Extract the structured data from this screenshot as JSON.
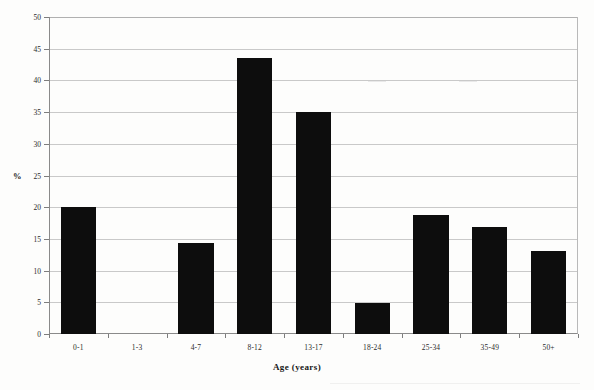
{
  "chart_data": {
    "type": "bar",
    "title": "",
    "xlabel": "Age (years)",
    "ylabel": "%",
    "categories": [
      "0-1",
      "1-3",
      "4-7",
      "8-12",
      "13-17",
      "18-24",
      "25-34",
      "35-49",
      "50+"
    ],
    "values": [
      20.0,
      0,
      14.4,
      43.6,
      35.0,
      4.9,
      18.7,
      16.9,
      13.1
    ],
    "ylim": [
      0,
      50
    ],
    "ytick_labels": [
      "0",
      "5",
      "10",
      "15",
      "20",
      "25",
      "30",
      "35",
      "40",
      "45",
      "50"
    ],
    "ytick_values": [
      0,
      5,
      10,
      15,
      20,
      25,
      30,
      35,
      40,
      45,
      50
    ],
    "ytick_interval": 5,
    "grid": "horizontal",
    "legend": "none",
    "bar_color": "#0d0d0d",
    "gridline_color": "#c9c9c9",
    "axis_color": "#8a8a8a",
    "background_color": "#fdfdfc"
  }
}
